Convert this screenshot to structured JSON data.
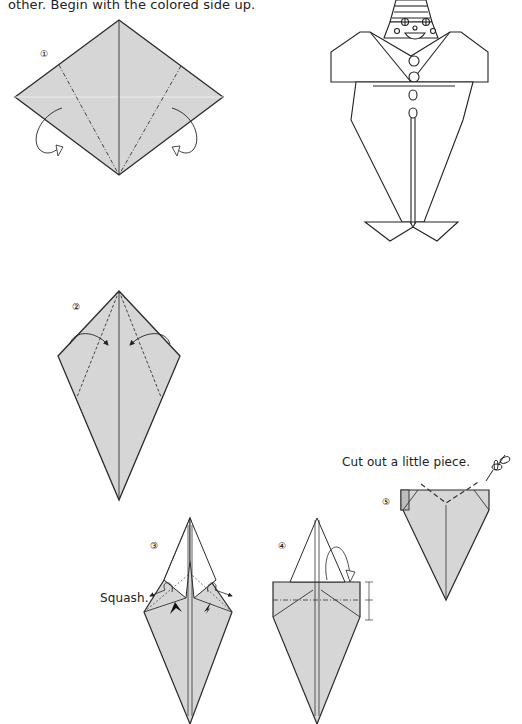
{
  "page": {
    "intro_text": "other. Begin with the colored side up.",
    "colors": {
      "paper": "#d6d6d6",
      "line": "#2a2a2a",
      "background": "#ffffff"
    }
  },
  "steps": [
    {
      "number": "1",
      "label": "①",
      "instruction": ""
    },
    {
      "number": "2",
      "label": "②",
      "instruction": ""
    },
    {
      "number": "3",
      "label": "③",
      "instruction": "Squash."
    },
    {
      "number": "4",
      "label": "④",
      "instruction": ""
    },
    {
      "number": "5",
      "label": "⑤",
      "instruction": "Cut out a little piece."
    }
  ],
  "finished_model": {
    "subject": "clown",
    "icon": "clown-figure"
  },
  "icons": {
    "cut": "scissors-icon"
  }
}
